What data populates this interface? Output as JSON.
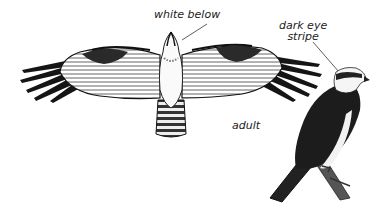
{
  "illustration": {
    "subject": "osprey",
    "labels": {
      "white_below": "white below",
      "dark_eye_stripe_line1": "dark eye",
      "dark_eye_stripe_line2": "stripe",
      "adult": "adult"
    },
    "colors": {
      "background": "#ffffff",
      "ink": "#111111",
      "dark_plumage": "#1c1c1c",
      "grey_barring": "#777777"
    }
  }
}
